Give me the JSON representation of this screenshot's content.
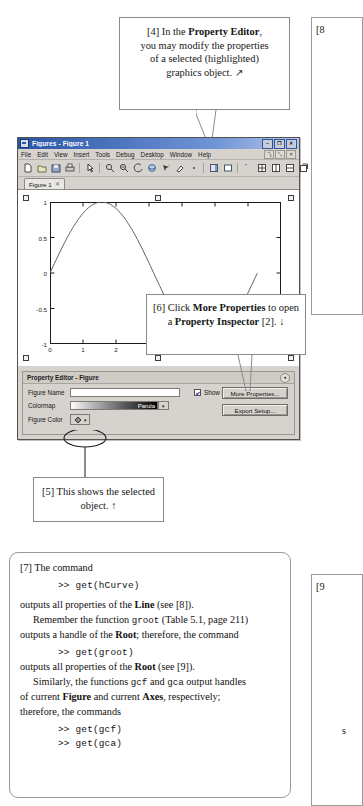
{
  "callout4": {
    "lines": [
      "[4] In the Property Editor,",
      "you may modify the properties",
      "of a selected (highlighted)",
      "graphics object."
    ],
    "l1a": "[4] In the ",
    "l1b": "Property Editor",
    "l1c": ",",
    "l2": "you may modify the properties",
    "l3": "of a selected (highlighted)",
    "l4": "graphics object.",
    "arrow": "↗"
  },
  "callout6": {
    "l1a": "[6] Click ",
    "l1b": "More Properties",
    "l2a": "to open a ",
    "l2b": "Property",
    "l3a": "Inspector",
    "l3b": " [2].",
    "arrow": "↓"
  },
  "callout5": {
    "l1": "[5] This shows the",
    "l2": "selected object.",
    "arrow": "↑"
  },
  "figure_window": {
    "title": "Figures - Figure 1",
    "window_buttons": [
      "–",
      "❐",
      "✕"
    ],
    "menu": [
      "File",
      "Edit",
      "View",
      "Insert",
      "Tools",
      "Debug",
      "Desktop",
      "Window",
      "Help"
    ],
    "dock_buttons": [
      "⤵",
      "⤡",
      "✕"
    ],
    "tab": {
      "label": "Figure 1",
      "close": "✕"
    },
    "toolbar_icons": [
      "new-figure-icon",
      "open-file-icon",
      "save-figure-icon",
      "print-figure-icon",
      "edit-plot-icon",
      "zoom-in-icon",
      "zoom-out-icon",
      "pan-icon",
      "rotate-3d-icon",
      "data-cursor-icon",
      "brush-icon",
      "link-plot-icon",
      "insert-colorbar-icon",
      "insert-legend-icon",
      "hide-plot-tools-icon",
      "show-plot-tools-icon",
      "dock-figure-icon",
      "tile-icon",
      "cascade-icon",
      "more-layout-icon"
    ]
  },
  "chart_data": {
    "type": "line",
    "title": "",
    "xlabel": "",
    "ylabel": "",
    "xlim": [
      0,
      7
    ],
    "ylim": [
      -1,
      1
    ],
    "xticks": [
      "0",
      "1",
      "2",
      "3",
      "4",
      "5",
      "6",
      "7"
    ],
    "yticks": [
      "-1",
      "-0.5",
      "0",
      "0.5",
      "1"
    ],
    "grid": false,
    "legend": "none",
    "series": [
      {
        "name": "hCurve",
        "color": "#606060",
        "x": [
          0,
          0.35,
          0.7,
          1.05,
          1.4,
          1.75,
          2.1,
          2.45,
          2.8,
          3.15,
          3.5,
          3.85,
          4.2,
          4.55,
          4.9,
          5.25,
          5.6,
          5.95,
          6.28
        ],
        "y": [
          0,
          0.343,
          0.644,
          0.867,
          0.985,
          0.984,
          0.863,
          0.638,
          0.335,
          -0.008,
          -0.351,
          -0.65,
          -0.872,
          -0.987,
          -0.982,
          -0.858,
          -0.631,
          -0.327,
          0
        ]
      }
    ],
    "selected": true,
    "selection_handles": 4
  },
  "property_editor": {
    "header": "Property Editor - Figure",
    "minimize": "●",
    "figure_name_label": "Figure Name",
    "figure_name_value": "",
    "colormap_label": "Colormap",
    "colormap_value": "Parula",
    "colormap_caret": "▾",
    "figure_color_label": "Figure Color",
    "figure_color_caret": "▾",
    "show_figure_number_label": "Show Figure Number",
    "show_figure_number_checked": true,
    "more_properties_button": "More Properties...",
    "export_setup_button": "Export Setup..."
  },
  "textbox7": {
    "p1": "[7] The command",
    "cmd1": ">> get(hCurve)",
    "p2a": "outputs all properties of the ",
    "p2b": "Line",
    "p2c": " (see [8]).",
    "p3a": "Remember the function ",
    "p3b": "groot",
    "p3c": " (Table 5.1, page 211)",
    "p4a": "outputs a handle of the ",
    "p4b": "Root",
    "p4c": "; therefore, the command",
    "cmd2": ">> get(groot)",
    "p5a": "outputs all properties of the ",
    "p5b": "Root",
    "p5c": " (see [9]).",
    "p6a": "Similarly, the functions ",
    "p6b": "gcf",
    "p6c": " and ",
    "p6d": "gca",
    "p6e": " output handles",
    "p7a": "of current ",
    "p7b": "Figure",
    "p7c": " and current ",
    "p7d": "Axes",
    "p7e": ", respectively;",
    "p8": "therefore, the commands",
    "cmd3": ">> get(gcf)",
    "cmd4": ">> get(gca)"
  },
  "edge_boxes": {
    "box8_label": "[8",
    "box9_label": "[9",
    "box9_frag": "s"
  },
  "colors": {
    "titlebar_start": "#2a55a8",
    "window_face": "#d6d3ce",
    "curve": "#606060",
    "checkbox_check": "#15308c"
  }
}
